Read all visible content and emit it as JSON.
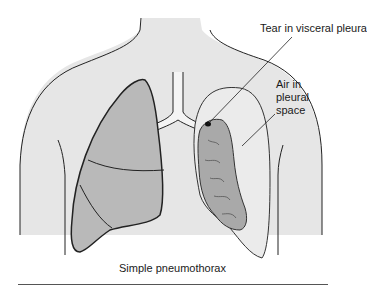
{
  "figure": {
    "caption": "Simple pneumothorax",
    "annotations": {
      "tear": "Tear in visceral pleura",
      "air_line1": "Air in",
      "air_line2": "pleural",
      "air_line3": "space"
    },
    "colors": {
      "body_fill": "#e6e6e6",
      "lung_fill": "#b9b9b9",
      "collapsed_lung_fill": "#a9a9a9",
      "pleural_space_fill": "#ebebeb",
      "outline": "#222222",
      "background": "#ffffff"
    }
  }
}
